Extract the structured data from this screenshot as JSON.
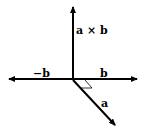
{
  "diagram": {
    "labels": {
      "cross": "a × b",
      "neg_b": "−b",
      "b": "b",
      "a": "a"
    },
    "colors": {
      "stroke": "#000000",
      "background": "#ffffff"
    }
  }
}
